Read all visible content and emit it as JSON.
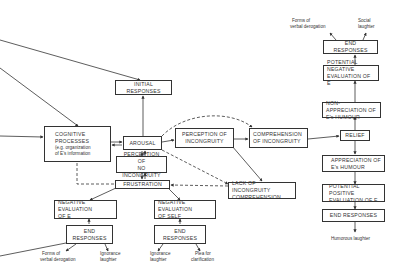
{
  "diagram": {
    "boxes": {
      "initial_responses": [
        "INITIAL RESPONSES"
      ],
      "cognitive_processes": {
        "lines": [
          "COGNITIVE",
          "PROCESSES"
        ],
        "sub": [
          "(e.g. organization",
          "of E's information"
        ]
      },
      "arousal": [
        "AROUSAL"
      ],
      "perception_of_incongruity": [
        "PERCEPTION OF",
        "INCONGRUITY"
      ],
      "comprehension_of_incongruity": [
        "COMPREHENSION",
        "OF INCONGRUITY"
      ],
      "perception_of_no_incongruity": [
        "PERCEPTION OF",
        "NO INCONGRUITY"
      ],
      "frustration": [
        "FRUSTRATION"
      ],
      "lack_of_incongruity_comprehension": [
        "LACK OF INCONGRUITY",
        "COMPREHENSION"
      ],
      "negative_evaluation_of_e": [
        "NEGATIVE EVALUATION",
        "OF  E"
      ],
      "end_responses_left": [
        "END RESPONSES"
      ],
      "negative_evaluation_of_self": [
        "NEGATIVE EVALUATION",
        "OF SELF"
      ],
      "end_responses_middle": [
        "END RESPONSES"
      ],
      "end_responses_top_right": [
        "END RESPONSES"
      ],
      "potential_negative_evaluation": [
        "POTENTIAL NEGATIVE",
        "EVALUATION OF E"
      ],
      "non_appreciation": [
        "NON-APPRECIATION OF",
        "E's HUMOUR"
      ],
      "relief": [
        "RELIEF"
      ],
      "appreciation": [
        "APPRECIATION OF",
        "E's HUMOUR"
      ],
      "potential_positive_evaluation": [
        "POTENTIAL POSITIVE",
        "EVALUATION OF E"
      ],
      "end_responses_bottom_right": [
        "END RESPONSES"
      ]
    },
    "labels": {
      "top_forms_of_verbal_derogation": [
        "Forms of",
        "verbal derogation"
      ],
      "top_social_laughter": [
        "Social",
        "laughter"
      ],
      "left_forms_of_verbal_derogation": [
        "Forms of",
        "verbal derogation"
      ],
      "left_ignorance_laughter": [
        "Ignorance",
        "laughter"
      ],
      "mid_ignorance_laughter": [
        "Ignorance",
        "laughter"
      ],
      "mid_plea_for_clarification": [
        "Plea for",
        "clarification"
      ],
      "humorous_laughter": [
        "Humorous laughter"
      ]
    }
  }
}
